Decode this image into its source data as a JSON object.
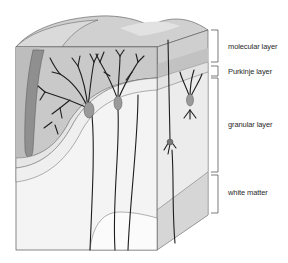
{
  "figure": {
    "layers": [
      {
        "id": "molecular",
        "label": "molecular layer",
        "bracket_top": 30,
        "bracket_bottom": 62,
        "label_y": 46
      },
      {
        "id": "purkinje",
        "label": "Purkinje layer",
        "bracket_top": 66,
        "bracket_bottom": 76,
        "label_y": 71
      },
      {
        "id": "granular",
        "label": "granular layer",
        "bracket_top": 78,
        "bracket_bottom": 172,
        "label_y": 124
      },
      {
        "id": "white-matter",
        "label": "white matter",
        "bracket_top": 175,
        "bracket_bottom": 213,
        "label_y": 192
      }
    ],
    "colors": {
      "molecular": "#c9c9c9",
      "molecular_light": "#d8d8d8",
      "purkinje": "#e6e6e6",
      "granular": "#efefef",
      "white_matter": "#f8f8f8",
      "outline": "#555555",
      "neuron": "#1e1e1e",
      "soma": "#9a9a9a",
      "side_face": "#dcdcdc"
    }
  }
}
